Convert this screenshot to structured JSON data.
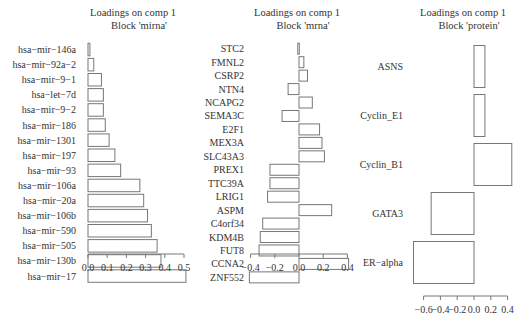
{
  "chart_data": [
    {
      "type": "bar",
      "orientation": "horizontal",
      "title": "Loadings on comp 1",
      "subtitle": "Block 'mirna'",
      "categories": [
        "hsa-mir-146a",
        "hsa-mir-92a-2",
        "hsa-mir-9-1",
        "hsa-let-7d",
        "hsa-mir-9-2",
        "hsa-mir-186",
        "hsa-mir-1301",
        "hsa-mir-197",
        "hsa-mir-93",
        "hsa-mir-106a",
        "hsa-mir-20a",
        "hsa-mir-106b",
        "hsa-mir-590",
        "hsa-mir-505",
        "hsa-mir-130b",
        "hsa-mir-17"
      ],
      "values": [
        0.01,
        0.03,
        0.07,
        0.08,
        0.08,
        0.09,
        0.11,
        0.14,
        0.17,
        0.27,
        0.29,
        0.31,
        0.33,
        0.36,
        0.38,
        0.51
      ],
      "xlim": [
        0.0,
        0.52
      ],
      "xticks": [
        0.0,
        0.1,
        0.2,
        0.3,
        0.4,
        0.5
      ],
      "xtick_labels": [
        "0.0",
        "0.1",
        "0.2",
        "0.3",
        "0.4",
        "0.5"
      ],
      "layout": {
        "plot_left": 88,
        "zero_px": 88,
        "px_per_unit": 192,
        "top": 42,
        "bar_step": 15.1,
        "bar_h": 12.5,
        "axis_y": 254,
        "title_x": 133,
        "label_x": 76
      }
    },
    {
      "type": "bar",
      "orientation": "horizontal",
      "title": "Loadings on comp 1",
      "subtitle": "Block 'mrna'",
      "categories": [
        "STC2",
        "FMNL2",
        "CSRP2",
        "NTN4",
        "NCAPG2",
        "SEMA3C",
        "E2F1",
        "MEX3A",
        "SLC43A3",
        "PREX1",
        "TTC39A",
        "LRIG1",
        "ASPM",
        "C4orf34",
        "KDM4B",
        "FUT8",
        "CCNA2",
        "ZNF552"
      ],
      "values": [
        -0.01,
        0.04,
        0.07,
        -0.09,
        0.11,
        -0.14,
        0.17,
        0.19,
        0.21,
        -0.24,
        -0.24,
        -0.26,
        0.27,
        -0.3,
        -0.32,
        -0.33,
        0.41,
        -0.41
      ],
      "xlim": [
        -0.42,
        0.42
      ],
      "xticks": [
        -0.4,
        -0.2,
        0.0,
        0.2,
        0.4
      ],
      "xtick_labels": [
        "-0.4",
        "-0.2",
        "0.0",
        "0.2",
        "0.4"
      ],
      "layout": {
        "plot_left": 249,
        "zero_px": 299,
        "px_per_unit": 121,
        "top": 42,
        "bar_step": 13.45,
        "bar_h": 11,
        "axis_y": 254,
        "title_x": 297,
        "label_x": 244
      }
    },
    {
      "type": "bar",
      "orientation": "horizontal",
      "title": "Loadings on comp 1",
      "subtitle": "Block 'protein'",
      "categories": [
        "ASNS",
        "Cyclin_E1",
        "Cyclin_B1",
        "GATA3",
        "ER-alpha"
      ],
      "values": [
        0.13,
        0.13,
        0.45,
        -0.51,
        -0.72
      ],
      "xlim": [
        -0.73,
        0.46
      ],
      "xticks": [
        -0.6,
        -0.4,
        -0.2,
        0.0,
        0.2,
        0.4
      ],
      "xtick_labels": [
        "-0.6",
        "-0.4",
        "-0.2",
        "0.0",
        "0.2",
        "0.4"
      ],
      "layout": {
        "plot_left": 423,
        "zero_px": 474,
        "px_per_unit": 84,
        "top": 42,
        "bar_step": 49,
        "bar_h": 42,
        "axis_y": 296,
        "title_x": 463,
        "label_x": 403
      }
    }
  ]
}
